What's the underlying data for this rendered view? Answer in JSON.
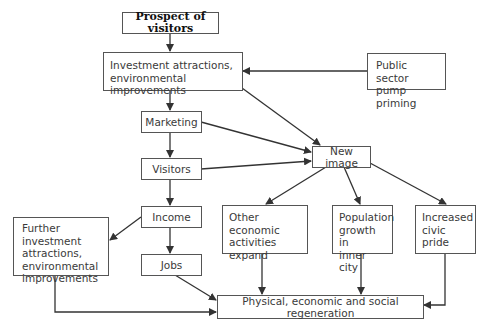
{
  "diagram": {
    "nodes": {
      "prospect": {
        "label": "Prospect of visitors"
      },
      "investment": {
        "label": "Investment attractions,\nenvironmental improvements"
      },
      "public_sector": {
        "label": "Public sector\npump priming"
      },
      "marketing": {
        "label": "Marketing"
      },
      "visitors": {
        "label": "Visitors"
      },
      "new_image": {
        "label": "New image"
      },
      "income": {
        "label": "Income"
      },
      "further_investment": {
        "label": "Further investment\nattractions,\nenvironmental\nimprovements"
      },
      "other_economic": {
        "label": "Other economic\nactivities\nexpand"
      },
      "population_growth": {
        "label": "Population\ngrowth in\ninner city"
      },
      "civic_pride": {
        "label": "Increased\ncivic pride"
      },
      "jobs": {
        "label": "Jobs"
      },
      "regeneration": {
        "label": "Physical, economic and social regeneration"
      }
    },
    "edges": [
      [
        "prospect",
        "investment"
      ],
      [
        "public_sector",
        "investment"
      ],
      [
        "investment",
        "marketing"
      ],
      [
        "investment",
        "new_image"
      ],
      [
        "marketing",
        "visitors"
      ],
      [
        "marketing",
        "new_image"
      ],
      [
        "visitors",
        "new_image"
      ],
      [
        "visitors",
        "income"
      ],
      [
        "new_image",
        "other_economic"
      ],
      [
        "new_image",
        "population_growth"
      ],
      [
        "new_image",
        "civic_pride"
      ],
      [
        "income",
        "further_investment"
      ],
      [
        "income",
        "jobs"
      ],
      [
        "further_investment",
        "regeneration"
      ],
      [
        "jobs",
        "regeneration"
      ],
      [
        "other_economic",
        "regeneration"
      ],
      [
        "population_growth",
        "regeneration"
      ],
      [
        "civic_pride",
        "regeneration"
      ]
    ],
    "colors": {
      "line": "#333333",
      "border": "#555555",
      "text": "#3a3a3a"
    }
  }
}
